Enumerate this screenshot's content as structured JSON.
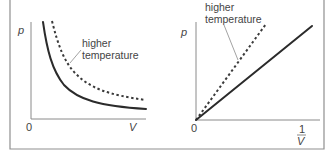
{
  "figure": {
    "colors": {
      "curve": "#2b2b2b",
      "axis": "#8a8a8a",
      "text": "#444444",
      "frame": "#8f8f8f"
    }
  },
  "left_panel": {
    "y_label": "p",
    "x_label": "V",
    "origin_label": "0",
    "annotation_line1": "higher",
    "annotation_line2": "temperature",
    "curves": [
      {
        "name": "lower temperature",
        "style": "solid",
        "shape": "hyperbola p = k/V"
      },
      {
        "name": "higher temperature",
        "style": "dashed",
        "shape": "hyperbola p = k'/V, k' > k"
      }
    ]
  },
  "right_panel": {
    "y_label": "p",
    "x_label_numerator": "1",
    "x_label_denominator": "V",
    "origin_label": "0",
    "annotation_line1": "higher",
    "annotation_line2": "temperature",
    "lines": [
      {
        "name": "lower temperature",
        "style": "solid",
        "shape": "straight line through origin, smaller slope"
      },
      {
        "name": "higher temperature",
        "style": "dashed",
        "shape": "straight line through origin, larger slope"
      }
    ]
  }
}
